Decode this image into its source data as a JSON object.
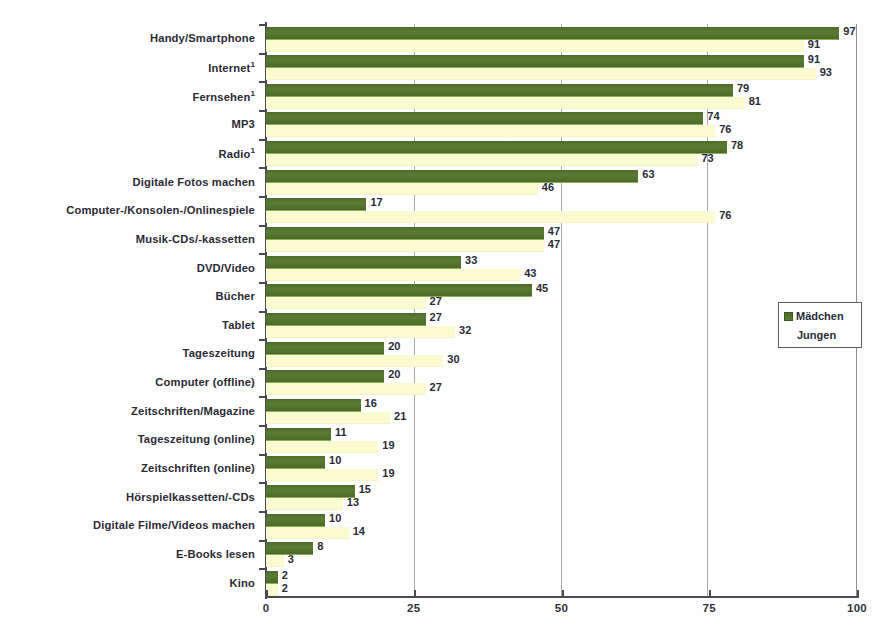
{
  "chart_data": {
    "type": "bar",
    "orientation": "horizontal",
    "title": "",
    "subtitle": "",
    "xlabel": "",
    "ylabel": "",
    "xlim": [
      0,
      100
    ],
    "xticks": [
      0,
      25,
      50,
      75,
      100
    ],
    "xtick_labels": [
      "0",
      "25",
      "50",
      "75",
      "100"
    ],
    "grid": true,
    "grid_axis": "x",
    "legend_position": "right",
    "categories": [
      "Handy/Smartphone",
      "Internet¹",
      "Fernsehen¹",
      "MP3",
      "Radio¹",
      "Digitale Fotos machen",
      "Computer-/Konsolen-/Onlinespiele",
      "Musik-CDs/-kassetten",
      "DVD/Video",
      "Bücher",
      "Tablet",
      "Tageszeitung",
      "Computer (offline)",
      "Zeitschriften/Magazine",
      "Tageszeitung (online)",
      "Zeitschriften (online)",
      "Hörspielkassetten/-CDs",
      "Digitale Filme/Videos machen",
      "E-Books lesen",
      "Kino"
    ],
    "series": [
      {
        "name": "Mädchen",
        "color": "#52712d",
        "values": [
          97,
          91,
          79,
          74,
          78,
          63,
          17,
          47,
          33,
          45,
          27,
          20,
          20,
          16,
          11,
          10,
          15,
          10,
          8,
          2
        ]
      },
      {
        "name": "Jungen",
        "color": "#fbfbd2",
        "values": [
          91,
          93,
          81,
          76,
          73,
          46,
          76,
          47,
          43,
          27,
          32,
          30,
          27,
          21,
          19,
          19,
          13,
          14,
          3,
          2
        ]
      }
    ]
  },
  "legend": {
    "entries": [
      {
        "label": "Mädchen",
        "swatch": "girls-swatch"
      },
      {
        "label": "Jungen",
        "swatch": "boys-swatch"
      }
    ]
  },
  "axis": {
    "x_tick_labels": [
      "0",
      "25",
      "50",
      "75",
      "100"
    ]
  }
}
